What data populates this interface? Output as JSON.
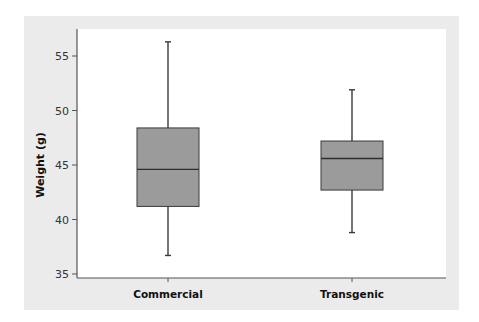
{
  "chart_data": {
    "type": "box",
    "title": "",
    "xlabel": "",
    "ylabel": "Weight (g)",
    "ylim": [
      34.6,
      57.4
    ],
    "yticks": [
      35,
      40,
      45,
      50,
      55
    ],
    "grid": false,
    "legend": null,
    "categories": [
      "Commercial",
      "Transgenic"
    ],
    "series": [
      {
        "name": "Commercial",
        "whisker_low": 36.7,
        "q1": 41.2,
        "median": 44.6,
        "q3": 48.4,
        "whisker_high": 56.3
      },
      {
        "name": "Transgenic",
        "whisker_low": 38.8,
        "q1": 42.7,
        "median": 45.6,
        "q3": 47.2,
        "whisker_high": 51.9
      }
    ],
    "colors": {
      "panel_bg": "#ebebeb",
      "plot_bg": "#ffffff",
      "box_fill": "#9b9b9b",
      "box_stroke": "#3a3a3a",
      "median": "#2e2e2e",
      "axis": "#555555"
    }
  }
}
